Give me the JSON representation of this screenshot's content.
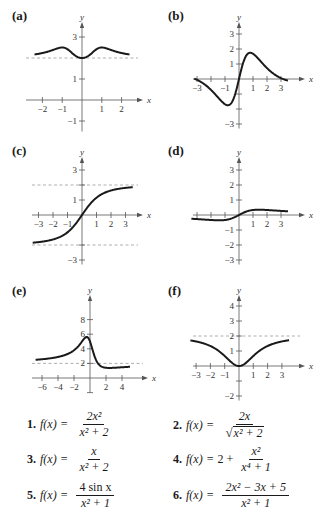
{
  "chart_data": [
    {
      "id": "a",
      "type": "line",
      "label": "(a)",
      "xlabel": "x",
      "ylabel": "y",
      "xlim": [
        -2.5,
        2.5
      ],
      "ylim": [
        -1.5,
        3.7
      ],
      "x_ticks": [
        -2,
        -1,
        1,
        2
      ],
      "x_tick_labels": [
        "−2",
        "−1",
        "1",
        "2"
      ],
      "y_ticks": [
        -1,
        1,
        3
      ],
      "y_tick_labels": [
        "−1",
        "1",
        "3"
      ],
      "y_minor_ticks": [
        2
      ],
      "asymptotes_y": [
        2
      ],
      "function": "2 + x^2/(x^4+1)",
      "curve_domain": [
        -2.4,
        2.4
      ]
    },
    {
      "id": "b",
      "type": "line",
      "label": "(b)",
      "xlabel": "x",
      "ylabel": "y",
      "xlim": [
        -3.3,
        3.7
      ],
      "ylim": [
        -3.3,
        4
      ],
      "x_ticks": [
        -3,
        -2,
        -1,
        1,
        2,
        3
      ],
      "x_tick_labels": [
        "−3",
        "",
        "−1",
        "1",
        "2",
        "3"
      ],
      "y_ticks": [
        -3,
        -2,
        -1,
        1,
        2,
        3
      ],
      "y_tick_labels": [
        "−3",
        "",
        "",
        "1",
        "2",
        "3"
      ],
      "asymptotes_y": [],
      "function": "4 sin(x)/(x^2+1)",
      "curve_domain": [
        -3.2,
        3.5
      ]
    },
    {
      "id": "c",
      "type": "line",
      "label": "(c)",
      "xlabel": "x",
      "ylabel": "y",
      "xlim": [
        -3.4,
        3.8
      ],
      "ylim": [
        -3.3,
        4
      ],
      "x_ticks": [
        -3,
        -2,
        -1,
        1,
        2,
        3
      ],
      "x_tick_labels": [
        "−3",
        "−2",
        "−1",
        "1",
        "2",
        "3"
      ],
      "y_ticks": [
        -3,
        -2,
        1,
        2,
        3
      ],
      "y_tick_labels": [
        "−3",
        "",
        "1",
        "",
        "3"
      ],
      "asymptotes_y": [
        2,
        -2
      ],
      "function": "2x/sqrt(x^2+2)",
      "curve_domain": [
        -3.4,
        3.5
      ]
    },
    {
      "id": "d",
      "type": "line",
      "label": "(d)",
      "xlabel": "x",
      "ylabel": "y",
      "xlim": [
        -3.4,
        3.8
      ],
      "ylim": [
        -3.3,
        4
      ],
      "x_ticks": [
        -3,
        -2,
        -1,
        1,
        2,
        3
      ],
      "x_tick_labels": [
        "",
        "",
        "",
        "1",
        "2",
        "3"
      ],
      "y_ticks": [
        -3,
        -2,
        -1,
        1,
        2,
        3
      ],
      "y_tick_labels": [
        "−3",
        "−2",
        "−1",
        "1",
        "2",
        "3"
      ],
      "asymptotes_y": [],
      "function": "x/(x^2+2)",
      "curve_domain": [
        -3.4,
        3.5
      ]
    },
    {
      "id": "e",
      "type": "line",
      "label": "(e)",
      "xlabel": "x",
      "ylabel": "y",
      "xlim": [
        -6.8,
        5.3
      ],
      "ylim": [
        -2,
        10
      ],
      "x_ticks": [
        -6,
        -4,
        -2,
        2,
        4
      ],
      "x_tick_labels": [
        "−6",
        "−4",
        "−2",
        "2",
        "4"
      ],
      "y_ticks": [
        2,
        4,
        6,
        8
      ],
      "y_tick_labels": [
        "2",
        "4",
        "6",
        "8"
      ],
      "y_minor_ticks": [
        -2
      ],
      "asymptotes_y": [
        2
      ],
      "function": "(2x^2-3x+5)/(x^2+1)",
      "curve_domain": [
        -6.8,
        5
      ]
    },
    {
      "id": "f",
      "type": "line",
      "label": "(f)",
      "xlabel": "x",
      "ylabel": "y",
      "xlim": [
        -3.4,
        3.8
      ],
      "ylim": [
        -2.3,
        5
      ],
      "x_ticks": [
        -3,
        -2,
        -1,
        1,
        2,
        3
      ],
      "x_tick_labels": [
        "−3",
        "−2",
        "−1",
        "1",
        "2",
        "3"
      ],
      "y_ticks": [
        -2,
        -1,
        1,
        2,
        3,
        4
      ],
      "y_tick_labels": [
        "−2",
        "",
        "1",
        "2",
        "3",
        "4"
      ],
      "asymptotes_y": [
        2
      ],
      "function": "2x^2/(x^2+2)",
      "curve_domain": [
        -3.4,
        3.5
      ]
    }
  ],
  "formulas": [
    {
      "num": "1.",
      "lhs": "f(x)",
      "eq": "=",
      "prefix": "",
      "numerator": "2x²",
      "denominator": "x² + 2",
      "sqrt_den": false
    },
    {
      "num": "2.",
      "lhs": "f(x)",
      "eq": "=",
      "prefix": "",
      "numerator": "2x",
      "denominator": "x² + 2",
      "sqrt_den": true
    },
    {
      "num": "3.",
      "lhs": "f(x)",
      "eq": "=",
      "prefix": "",
      "numerator": "x",
      "denominator": "x² + 2",
      "sqrt_den": false
    },
    {
      "num": "4.",
      "lhs": "f(x)",
      "eq": "=",
      "prefix": "2 +",
      "numerator": "x²",
      "denominator": "x⁴ + 1",
      "sqrt_den": false
    },
    {
      "num": "5.",
      "lhs": "f(x)",
      "eq": "=",
      "prefix": "",
      "numerator": "4 sin x",
      "denominator": "x² + 1",
      "sqrt_den": false
    },
    {
      "num": "6.",
      "lhs": "f(x)",
      "eq": "=",
      "prefix": "",
      "numerator": "2x² − 3x + 5",
      "denominator": "x² + 1",
      "sqrt_den": false
    }
  ]
}
